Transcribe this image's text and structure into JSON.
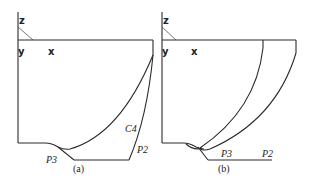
{
  "panels": [
    {
      "id": "a",
      "caption": "(a)",
      "axes": {
        "z": "z",
        "y": "y",
        "x": "x"
      },
      "curve_labels": {
        "c4": "C4",
        "p2": "P2",
        "p3": "P3"
      }
    },
    {
      "id": "b",
      "caption": "(b)",
      "axes": {
        "z": "z",
        "y": "y",
        "x": "x"
      },
      "curve_labels": {
        "p3": "P3",
        "p2": "P2"
      }
    }
  ],
  "colors": {
    "line": "#2a2a2a",
    "background": "#ffffff"
  }
}
